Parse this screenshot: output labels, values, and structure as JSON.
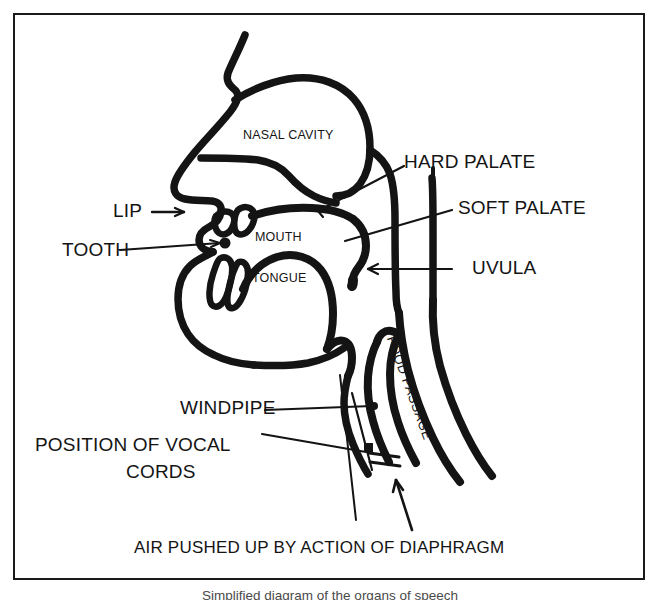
{
  "figure": {
    "title": "Simplified diagram of the organs of speech",
    "caption": "Simplified diagram of the organs of speech",
    "border_color": "#1a1a1a",
    "ink_color": "#141414",
    "background_color": "#ffffff"
  },
  "labels": {
    "nasal_cavity": "NASAL CAVITY",
    "hard_palate": "HARD PALATE",
    "soft_palate": "SOFT PALATE",
    "uvula": "UVULA",
    "lip": "LIP",
    "tooth": "TOOTH",
    "mouth": "MOUTH",
    "tongue": "TONGUE",
    "food_passage": "FOOD PASSAGE",
    "windpipe": "WINDPIPE",
    "vocal_cords_line1": "POSITION OF VOCAL",
    "vocal_cords_line2": "CORDS",
    "airflow": "AIR PUSHED UP BY ACTION OF DIAPHRAGM"
  },
  "annotations": {
    "airflow_arrow": "upward-arrow",
    "lip_arrow": "right-arrow",
    "tooth_arrow": "right-arrow",
    "uvula_arrow": "left-arrow",
    "hard_palate_leader": "leader-line",
    "soft_palate_leader": "leader-line",
    "windpipe_leader": "leader-line",
    "vocal_cords_leader": "leader-line"
  }
}
